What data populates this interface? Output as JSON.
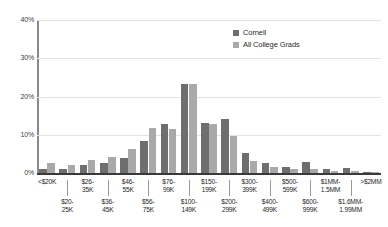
{
  "chart_data": {
    "type": "bar",
    "title": "",
    "subtitle": "",
    "xlabel": "",
    "ylabel": "",
    "ylim": [
      0,
      40
    ],
    "yunit": "%",
    "grid": true,
    "legend_position": "top-right",
    "ytick_labels": [
      "40%",
      "30%",
      "20%",
      "10%",
      "0%"
    ],
    "ytick_values": [
      40,
      30,
      20,
      10,
      0
    ],
    "categories": [
      "<$20K",
      "$20-\n25K",
      "$26-\n35K",
      "$36-\n45K",
      "$46-\n55K",
      "$56-\n75K",
      "$76-\n99K",
      "$100-\n149K",
      "$150-\n199K",
      "$200-\n299K",
      "$300-\n399K",
      "$400-\n499K",
      "$500-\n599K",
      "$600-\n999K",
      "$1MM-\n1.5MM",
      "$1.6MM-\n1.99MM",
      ">$2MM"
    ],
    "category_rows": [
      0,
      1,
      0,
      1,
      0,
      1,
      0,
      1,
      0,
      1,
      0,
      1,
      0,
      1,
      0,
      1,
      0
    ],
    "series": [
      {
        "name": "Cornell",
        "color": "#6e6e6e",
        "values": [
          1.0,
          1.1,
          2.1,
          2.6,
          3.9,
          8.3,
          12.8,
          23.2,
          13.2,
          14.0,
          5.3,
          2.6,
          1.6,
          2.9,
          1.0,
          1.2,
          0.3
        ]
      },
      {
        "name": "All College Grads",
        "color": "#a9a9a9",
        "values": [
          2.5,
          2.2,
          3.4,
          4.3,
          6.4,
          11.8,
          11.4,
          23.4,
          12.9,
          9.6,
          3.1,
          1.6,
          1.0,
          1.1,
          0.5,
          0.4,
          0.2
        ]
      }
    ]
  },
  "legend": {
    "items": [
      {
        "label": "Cornell"
      },
      {
        "label": "All College Grads"
      }
    ]
  }
}
